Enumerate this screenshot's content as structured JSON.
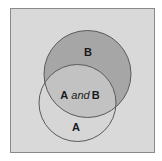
{
  "diagram": {
    "type": "venn",
    "sets": [
      {
        "id": "A",
        "label": "A"
      },
      {
        "id": "B",
        "label": "B"
      }
    ],
    "intersection": {
      "label_left": "A",
      "label_connector": "and",
      "label_right": "B"
    },
    "colors": {
      "background": "#d9d9d9",
      "frame": "#8a8a8a",
      "set_b": "#a6a6a6",
      "set_a": "#d6d6d6",
      "intersection": "#c2c2c2",
      "outline": "#5a5a5a"
    }
  }
}
